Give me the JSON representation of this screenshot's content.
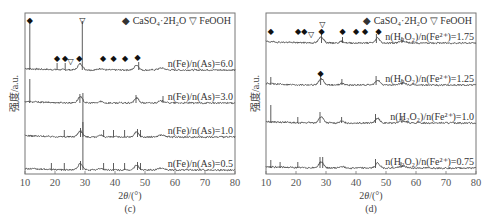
{
  "chart_data": [
    {
      "type": "line",
      "panel": "(c)",
      "title": "",
      "xlabel": "2θ/(°)",
      "ylabel": "强度/a.u.",
      "xlim": [
        10,
        80
      ],
      "xticks": [
        10,
        20,
        30,
        40,
        50,
        60,
        70,
        80
      ],
      "legend": [
        "CaSO4·2H2O",
        "FeOOH"
      ],
      "legend_position": "top-right",
      "grid": false,
      "series": [
        {
          "name": "n(Fe)/n(As)=6.0",
          "peaks_2theta": [
            11.6,
            20.7,
            23.4,
            29.1,
            47.9
          ],
          "markers_caso4": [
            11.6,
            20.7,
            23.4,
            28.1,
            36.0,
            39.5,
            43.4,
            47.5
          ],
          "markers_feooh": [
            25.2,
            29.1
          ]
        },
        {
          "name": "n(Fe)/n(As)=3.0",
          "peaks_2theta": [
            11.6,
            28.3,
            47.0,
            56.0
          ]
        },
        {
          "name": "n(Fe)/n(As)=1.0",
          "peaks_2theta": [
            23.1,
            28.5,
            29.3,
            36.2,
            39.5,
            43.2,
            47.5,
            48.5
          ]
        },
        {
          "name": "n(Fe)/n(As)=0.5",
          "peaks_2theta": [
            18.8,
            23.1,
            28.5,
            29.3,
            36.2,
            39.5,
            43.2,
            47.5,
            48.5
          ]
        }
      ]
    },
    {
      "type": "line",
      "panel": "(d)",
      "title": "",
      "xlabel": "2θ/(°)",
      "ylabel": "强度/a.u.",
      "xlim": [
        10,
        80
      ],
      "xticks": [
        10,
        20,
        30,
        40,
        50,
        60,
        70,
        80
      ],
      "legend": [
        "CaSO4·2H2O",
        "FeOOH"
      ],
      "legend_position": "top-right",
      "grid": false,
      "series": [
        {
          "name": "n(H2O2)/n(Fe2+)=1.75",
          "peaks_2theta": [
            28.5,
            35.5,
            46.8,
            55.3
          ],
          "markers_caso4": [
            11.6,
            20.7,
            22.8,
            28.5,
            35.5,
            40.0,
            43.0,
            47.5
          ],
          "markers_feooh": [
            25.0,
            28.8
          ]
        },
        {
          "name": "n(H2O2)/n(Fe2+)=1.25",
          "peaks_2theta": [
            11.6,
            28.2,
            35.3,
            46.7,
            55.3
          ],
          "markers_caso4": [
            28.2
          ]
        },
        {
          "name": "n(H2O2)/n(Fe2+)=1.0",
          "peaks_2theta": [
            11.6,
            20.6,
            28.0,
            35.2,
            46.5,
            55.3
          ]
        },
        {
          "name": "n(H2O2)/n(Fe2+)=0.75",
          "peaks_2theta": [
            11.6,
            14.7,
            20.6,
            28.0,
            28.9,
            46.5,
            55.0
          ]
        }
      ]
    }
  ],
  "panels": {
    "c": {
      "caption": "(c)",
      "xlabel_prefix": "2",
      "xlabel_theta": "θ",
      "xlabel_suffix": "/(°)",
      "ylabel": "强度/a.u.",
      "legend_caso4": "CaSO₄·2H₂O",
      "legend_feooh": "FeOOH",
      "curve_labels": [
        "n(Fe)/n(As)=6.0",
        "n(Fe)/n(As)=3.0",
        "n(Fe)/n(As)=1.0",
        "n(Fe)/n(As)=0.5"
      ],
      "ticks": [
        "10",
        "20",
        "30",
        "40",
        "50",
        "60",
        "70",
        "80"
      ]
    },
    "d": {
      "caption": "(d)",
      "xlabel_prefix": "2",
      "xlabel_theta": "θ",
      "xlabel_suffix": "/(°)",
      "ylabel": "强度/a.u.",
      "legend_caso4": "CaSO₄·2H₂O",
      "legend_feooh": "FeOOH",
      "curve_labels": [
        "n(H₂O₂)/n(Fe²⁺)=1.75",
        "n(H₂O₂)/n(Fe²⁺)=1.25",
        "n(H₂O₂)/n(Fe²⁺)=1.0",
        "n(H₂O₂)/n(Fe²⁺)=0.75"
      ],
      "ticks": [
        "10",
        "20",
        "30",
        "40",
        "50",
        "60",
        "70",
        "80"
      ]
    }
  },
  "colors": {
    "curve": "#4a4a4a",
    "frame": "#777777",
    "marker": "#111111"
  }
}
